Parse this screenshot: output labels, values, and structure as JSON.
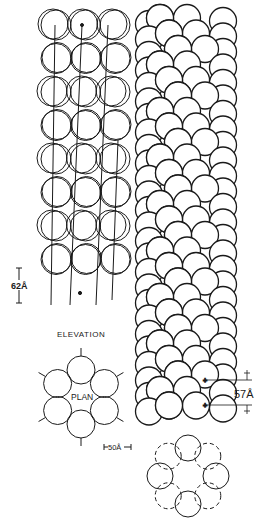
{
  "figure": {
    "elevation_label": "ELEVATION",
    "plan_label": "PLAN",
    "scale_62": "62Å",
    "scale_50": "50Å",
    "scale_57": "57Å",
    "colors": {
      "ink": "#1a1a1a",
      "background": "#ffffff"
    }
  },
  "elevation": {
    "columns": 3,
    "rows": 8,
    "subunit_radius_px": 15,
    "axial_spacing": "62Å"
  },
  "plan": {
    "subunits": 6,
    "subunit_spacing": "50Å"
  },
  "helical_model": {
    "pitch_spacing": "57Å"
  }
}
